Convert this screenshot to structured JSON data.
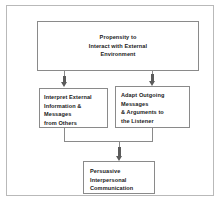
{
  "diagram": {
    "type": "flowchart",
    "frame": {
      "border_color": "#b9b9b9",
      "background": "#ffffff"
    },
    "node_border_color": "#8a8a8a",
    "arrow_color": "#5b5b5b",
    "nodes": {
      "top": {
        "id": "propensity",
        "lines": [
          "Propensity to",
          "Interact with External",
          "Environment"
        ],
        "align": "center"
      },
      "left": {
        "id": "interpret-external",
        "lines": [
          "Interpret External",
          "Information &",
          "Messages",
          "from Others"
        ],
        "align": "left"
      },
      "right": {
        "id": "adapt-outgoing",
        "lines": [
          "Adapt Outgoing",
          "Messages",
          "& Arguments to",
          "the Listener"
        ],
        "align": "left"
      },
      "bottom": {
        "id": "persuasive-communication",
        "lines": [
          "Persuasive",
          "Interpersonal",
          "Communication"
        ],
        "align": "left"
      }
    },
    "edges": [
      {
        "from": "propensity",
        "to": "interpret-external",
        "style": "arrow-down"
      },
      {
        "from": "propensity",
        "to": "adapt-outgoing",
        "style": "arrow-down"
      },
      {
        "from": "interpret-external",
        "to": "persuasive-communication",
        "style": "merge-arrow-down"
      },
      {
        "from": "adapt-outgoing",
        "to": "persuasive-communication",
        "style": "merge-arrow-down"
      }
    ]
  }
}
